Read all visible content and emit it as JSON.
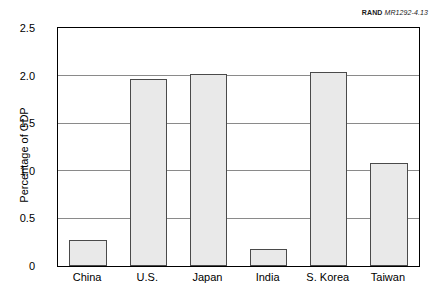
{
  "source_label": {
    "org": "RAND",
    "code": "MR1292-4.13"
  },
  "chart_data": {
    "type": "bar",
    "title": "",
    "xlabel": "",
    "ylabel": "Percentage of GDP",
    "categories": [
      "China",
      "U.S.",
      "Japan",
      "India",
      "S. Korea",
      "Taiwan"
    ],
    "values": [
      0.27,
      1.96,
      2.02,
      0.18,
      2.04,
      1.08
    ],
    "ylim": [
      0,
      2.5
    ],
    "ytick_values": [
      0,
      0.5,
      1.0,
      1.5,
      2.0,
      2.5
    ],
    "ytick_labels": [
      "0",
      "0.5",
      "1.0",
      "1.5",
      "2.0",
      "2.5"
    ],
    "grid": true,
    "grid_axis": "y",
    "legend": false,
    "bar_fill_color": "#e9e9e9",
    "bar_edge_color": "#4a4a4a",
    "gridline_color": "#8a8a8a",
    "frame_color": "#000000",
    "background_color": "#ffffff"
  }
}
